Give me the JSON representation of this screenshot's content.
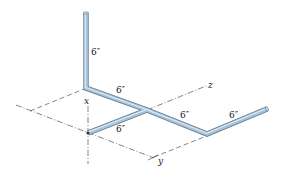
{
  "diagram": {
    "type": "isometric pipe assembly",
    "axes": {
      "x": "x",
      "y": "y",
      "z": "z"
    },
    "dimensions": {
      "vertical_segment": "6″",
      "upper_diagonal_segment": "6″",
      "lower_diagonal_segment": "6″",
      "z_direction_segment": "6″",
      "final_segment": "6″"
    },
    "colors": {
      "pipe_fill": "#a9c2d6",
      "pipe_edge": "#5f7f98",
      "pipe_highlight": "#dbe7f0",
      "axis_line": "#333333"
    }
  }
}
